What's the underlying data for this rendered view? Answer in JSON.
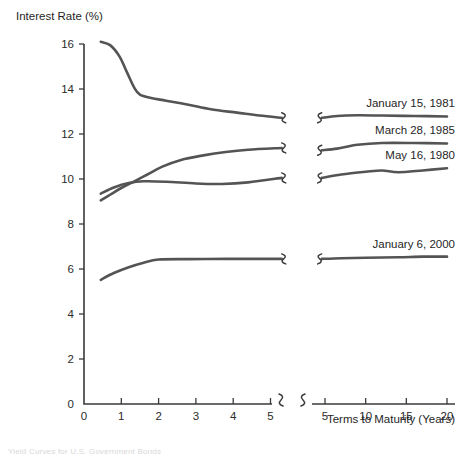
{
  "chart_data": {
    "type": "line",
    "title": "",
    "ylabel": "Interest Rate (%)",
    "xlabel": "Terms to Maturity (Years)",
    "ylim": [
      0,
      16
    ],
    "y_ticks": [
      0,
      2,
      4,
      6,
      8,
      10,
      12,
      14,
      16
    ],
    "x_ticks_left": [
      0,
      1,
      2,
      3,
      4,
      5
    ],
    "x_ticks_right": [
      5,
      10,
      15,
      20
    ],
    "axis_break": true,
    "grid": false,
    "legend_position": "right-inline-labels",
    "line_color": "#545454",
    "axis_color": "#3a3a3a",
    "series": [
      {
        "name": "January 15, 1981",
        "label": "January 15, 1981",
        "left_segment": [
          [
            0.45,
            16.1
          ],
          [
            0.7,
            15.95
          ],
          [
            0.95,
            15.45
          ],
          [
            1.15,
            14.75
          ],
          [
            1.35,
            14.05
          ],
          [
            1.5,
            13.75
          ],
          [
            1.8,
            13.6
          ],
          [
            2.2,
            13.48
          ],
          [
            2.8,
            13.3
          ],
          [
            3.4,
            13.1
          ],
          [
            4.1,
            12.95
          ],
          [
            4.7,
            12.82
          ],
          [
            5.3,
            12.72
          ]
        ],
        "right_segment": [
          [
            4.6,
            12.72
          ],
          [
            6.5,
            12.8
          ],
          [
            9.0,
            12.83
          ],
          [
            12.0,
            12.82
          ],
          [
            16.0,
            12.8
          ],
          [
            20.0,
            12.78
          ]
        ]
      },
      {
        "name": "March 28, 1985",
        "label": "March 28, 1985",
        "left_segment": [
          [
            0.45,
            9.05
          ],
          [
            0.7,
            9.3
          ],
          [
            1.0,
            9.6
          ],
          [
            1.3,
            9.85
          ],
          [
            1.7,
            10.2
          ],
          [
            2.1,
            10.55
          ],
          [
            2.6,
            10.85
          ],
          [
            3.2,
            11.05
          ],
          [
            3.8,
            11.2
          ],
          [
            4.4,
            11.3
          ],
          [
            5.3,
            11.38
          ]
        ],
        "right_segment": [
          [
            4.6,
            11.28
          ],
          [
            6.5,
            11.35
          ],
          [
            9.0,
            11.52
          ],
          [
            12.0,
            11.6
          ],
          [
            16.0,
            11.6
          ],
          [
            20.0,
            11.58
          ]
        ]
      },
      {
        "name": "May 16, 1980",
        "label": "May 16, 1980",
        "left_segment": [
          [
            0.45,
            9.35
          ],
          [
            0.8,
            9.62
          ],
          [
            1.2,
            9.82
          ],
          [
            1.6,
            9.9
          ],
          [
            2.2,
            9.88
          ],
          [
            3.0,
            9.8
          ],
          [
            3.7,
            9.78
          ],
          [
            4.4,
            9.85
          ],
          [
            5.3,
            10.05
          ]
        ],
        "right_segment": [
          [
            4.6,
            10.05
          ],
          [
            7.0,
            10.2
          ],
          [
            10.0,
            10.32
          ],
          [
            12.0,
            10.38
          ],
          [
            14.0,
            10.3
          ],
          [
            17.0,
            10.38
          ],
          [
            20.0,
            10.48
          ]
        ]
      },
      {
        "name": "January 6, 2000",
        "label": "January 6, 2000",
        "left_segment": [
          [
            0.45,
            5.52
          ],
          [
            0.8,
            5.82
          ],
          [
            1.2,
            6.08
          ],
          [
            1.6,
            6.28
          ],
          [
            2.0,
            6.42
          ],
          [
            2.8,
            6.44
          ],
          [
            3.8,
            6.45
          ],
          [
            4.5,
            6.45
          ],
          [
            5.3,
            6.45
          ]
        ],
        "right_segment": [
          [
            4.6,
            6.45
          ],
          [
            7.0,
            6.48
          ],
          [
            10.0,
            6.5
          ],
          [
            14.0,
            6.52
          ],
          [
            17.0,
            6.55
          ],
          [
            20.0,
            6.55
          ]
        ]
      }
    ]
  },
  "footer": {
    "caption": "Yield Curves for U.S. Government Bonds"
  }
}
